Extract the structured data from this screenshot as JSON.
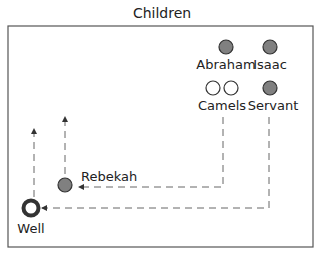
{
  "title": "Children",
  "colors": {
    "filled": "#808080",
    "stroke": "#333333",
    "frame": "#555555",
    "dash": "#666666"
  },
  "nodes": [
    {
      "id": "abraham",
      "label": "Abraham",
      "filled": true
    },
    {
      "id": "isaac",
      "label": "Isaac",
      "filled": true
    },
    {
      "id": "camels",
      "label": "Camels",
      "filled": false,
      "count": 2
    },
    {
      "id": "servant",
      "label": "Servant",
      "filled": true
    },
    {
      "id": "rebekah",
      "label": "Rebekah",
      "filled": true
    },
    {
      "id": "well",
      "label": "Well",
      "type": "ring"
    }
  ],
  "labels": {
    "abraham": "Abraham",
    "isaac": "Isaac",
    "camels": "Camels",
    "servant": "Servant",
    "rebekah": "Rebekah",
    "well": "Well"
  },
  "paths": [
    {
      "from": "Camels",
      "to": "Rebekah",
      "style": "dashed-arrow"
    },
    {
      "from": "Servant",
      "to": "Well",
      "style": "dashed-arrow"
    },
    {
      "from": "Rebekah",
      "to": "up",
      "style": "dashed-arrow"
    },
    {
      "from": "Well",
      "to": "up",
      "style": "dashed-arrow"
    }
  ]
}
